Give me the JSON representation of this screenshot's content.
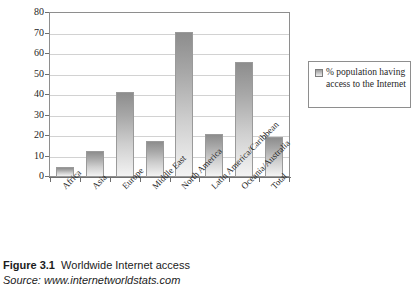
{
  "chart_data": {
    "type": "bar",
    "title": "",
    "xlabel": "",
    "ylabel": "",
    "ylim": [
      0,
      80
    ],
    "ytick_step": 10,
    "yticks": [
      "80",
      "70",
      "60",
      "50",
      "40",
      "30",
      "20",
      "10",
      "0"
    ],
    "grid": true,
    "legend_position": "right",
    "categories": [
      "Africa",
      "Asia",
      "Europe",
      "Middle East",
      "North America",
      "Latin America/Caribbean",
      "Oceania/Australia",
      "Total"
    ],
    "values": [
      5,
      12.5,
      41.5,
      17.5,
      70.5,
      21,
      56,
      19.5
    ],
    "series": [
      {
        "name": "% population having access to the Internet",
        "values": [
          5,
          12.5,
          41.5,
          17.5,
          70.5,
          21,
          56,
          19.5
        ]
      }
    ]
  },
  "legend": {
    "label": "% population having access to the Internet",
    "swatch_name": "bar-series-swatch"
  },
  "caption": {
    "figure_number": "Figure 3.1",
    "title": "Worldwide Internet access",
    "source_prefix": "Source:",
    "source_url": "www.internetworldstats.com"
  },
  "colors": {
    "bar_top": "#8d8d8d",
    "bar_bottom": "#f3f3f3",
    "axis": "#6f6f6f",
    "gridline": "#d2d2d2",
    "frame": "#8e8e8e",
    "text": "#262626"
  }
}
